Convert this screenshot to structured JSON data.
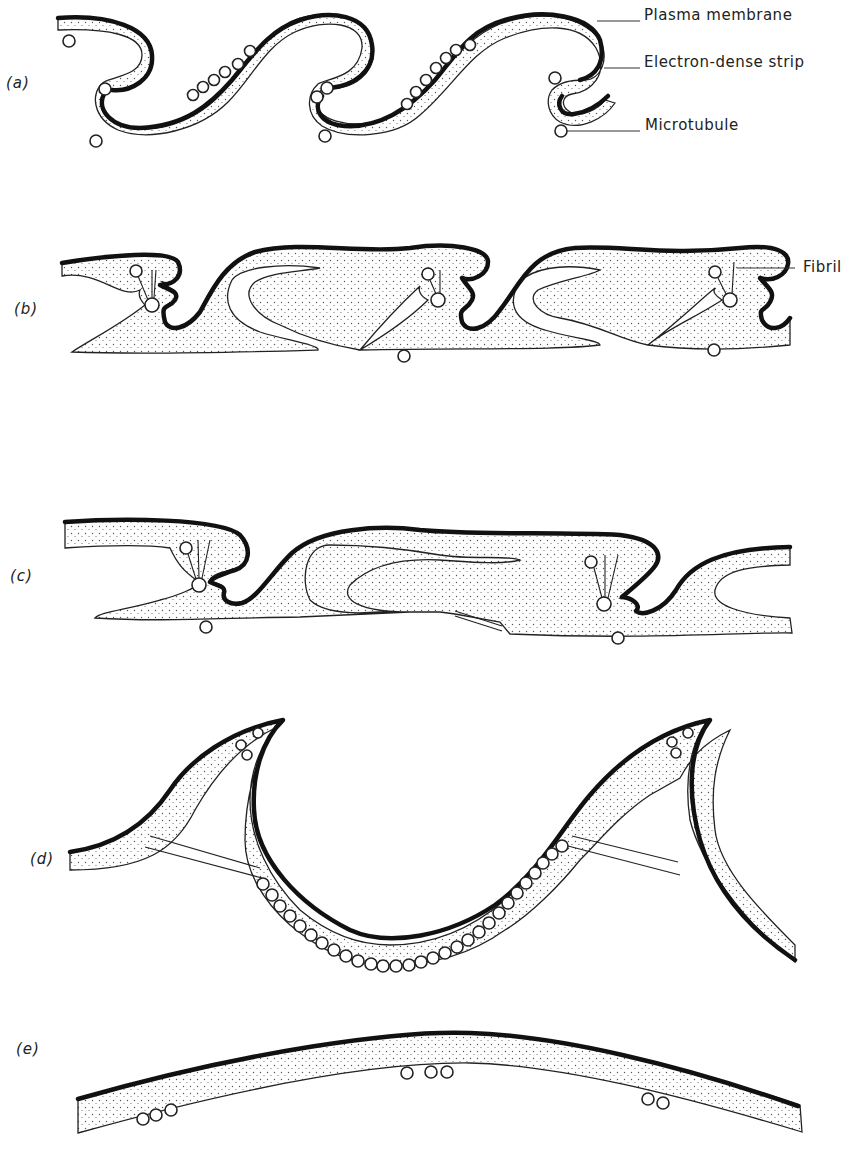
{
  "figure": {
    "panels": [
      {
        "id": "a",
        "label": "(a)"
      },
      {
        "id": "b",
        "label": "(b)"
      },
      {
        "id": "c",
        "label": "(c)"
      },
      {
        "id": "d",
        "label": "(d)"
      },
      {
        "id": "e",
        "label": "(e)"
      }
    ],
    "callouts": {
      "plasma_membrane": "Plasma membrane",
      "electron_dense_strip": "Electron-dense strip",
      "microtubule": "Microtubule",
      "fibril": "Fibril"
    },
    "colors": {
      "ink": "#111111",
      "background": "#ffffff",
      "stipple": "#555555"
    }
  }
}
